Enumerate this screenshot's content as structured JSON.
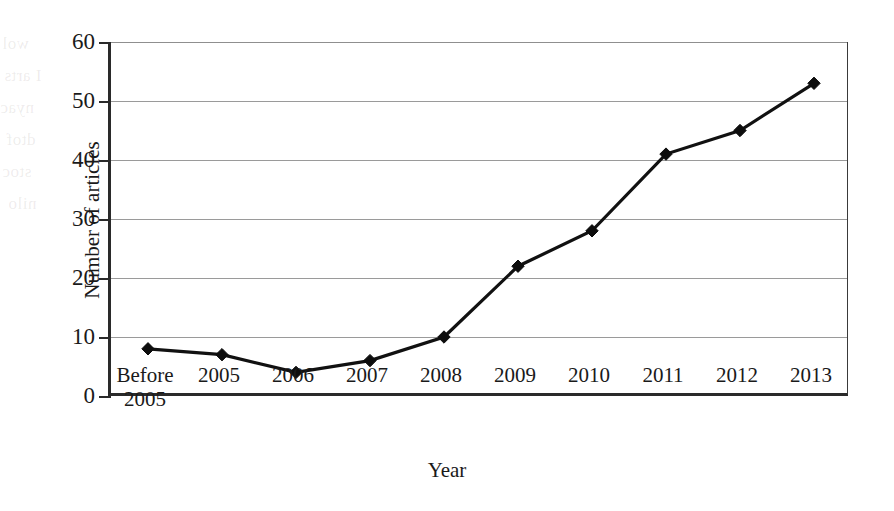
{
  "chart_data": {
    "type": "line",
    "title": "",
    "xlabel": "Year",
    "ylabel": "Number of articles",
    "categories": [
      "Before\n2005",
      "2005",
      "2006",
      "2007",
      "2008",
      "2009",
      "2010",
      "2011",
      "2012",
      "2013"
    ],
    "values": [
      8,
      7,
      4,
      6,
      10,
      22,
      28,
      41,
      45,
      53
    ],
    "series": [
      {
        "name": "Number of articles",
        "values": [
          8,
          7,
          4,
          6,
          10,
          22,
          28,
          41,
          45,
          53
        ]
      }
    ],
    "ylim": [
      0,
      60
    ],
    "ytick_labels": [
      "0",
      "10",
      "20",
      "30",
      "40",
      "50",
      "60"
    ],
    "ytick_values": [
      0,
      10,
      20,
      30,
      40,
      50,
      60
    ],
    "grid": "horizontal",
    "legend": "none",
    "marker": "diamond",
    "line_color": "#111111",
    "marker_color": "#0d0d0d",
    "grid_color": "#9a9a9a",
    "axis_color": "#2a2a2a",
    "background": "#ffffff"
  },
  "ghost_text": {
    "lines": [
      "wol",
      "I arts",
      "nyac",
      "dtof",
      "stoc",
      "nilo"
    ]
  }
}
